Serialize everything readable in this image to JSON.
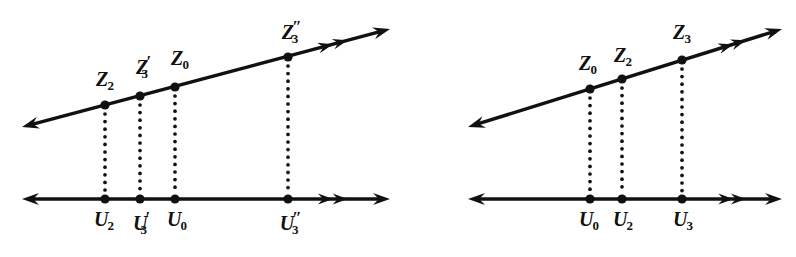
{
  "figure": {
    "background_color": "#ffffff",
    "ink_color": "#111111",
    "panels": [
      {
        "name": "left-panel",
        "slanted_line": {
          "name": "z-axis-line",
          "left_arrowhead": "single",
          "right_arrowhead": "single",
          "mid_chevrons": 2
        },
        "horizontal_line": {
          "name": "u-axis-line",
          "left_arrowhead": "single",
          "right_arrowhead": "single",
          "mid_chevrons": 2
        },
        "points": [
          {
            "z_label": "Z",
            "z_sub": "2",
            "z_prime": "",
            "u_label": "U",
            "u_sub": "2",
            "u_prime": ""
          },
          {
            "z_label": "Z",
            "z_sub": "3",
            "z_prime": "′",
            "u_label": "U",
            "u_sub": "3",
            "u_prime": "′"
          },
          {
            "z_label": "Z",
            "z_sub": "0",
            "z_prime": "",
            "u_label": "U",
            "u_sub": "0",
            "u_prime": ""
          },
          {
            "z_label": "Z",
            "z_sub": "3",
            "z_prime": "″",
            "u_label": "U",
            "u_sub": "3",
            "u_prime": "″"
          }
        ]
      },
      {
        "name": "right-panel",
        "slanted_line": {
          "name": "z-axis-line",
          "left_arrowhead": "single",
          "right_arrowhead": "single",
          "mid_chevrons": 2
        },
        "horizontal_line": {
          "name": "u-axis-line",
          "left_arrowhead": "single",
          "right_arrowhead": "single",
          "mid_chevrons": 2
        },
        "points": [
          {
            "z_label": "Z",
            "z_sub": "0",
            "z_prime": "",
            "u_label": "U",
            "u_sub": "0",
            "u_prime": ""
          },
          {
            "z_label": "Z",
            "z_sub": "2",
            "z_prime": "",
            "u_label": "U",
            "u_sub": "2",
            "u_prime": ""
          },
          {
            "z_label": "Z",
            "z_sub": "3",
            "z_prime": "",
            "u_label": "U",
            "u_sub": "3",
            "u_prime": ""
          }
        ]
      }
    ]
  },
  "chart_data": {
    "type": "scatter",
    "title": "",
    "xlabel": "",
    "ylabel": "",
    "grid": false,
    "legend": null,
    "panels": [
      {
        "id": "left",
        "u_line_y": 199,
        "z_line": {
          "x1": 22,
          "y1": 127,
          "x2": 390,
          "y2": 29
        },
        "u_line": {
          "x1": 22,
          "y1": 199,
          "x2": 390,
          "y2": 199
        },
        "points_x": [
          105,
          140,
          175,
          288
        ],
        "z_points": [
          {
            "label": "Z_2",
            "x": 105,
            "y": 105
          },
          {
            "label": "Z_3prime",
            "x": 140,
            "y": 96
          },
          {
            "label": "Z_0",
            "x": 175,
            "y": 87
          },
          {
            "label": "Z_3dprime",
            "x": 288,
            "y": 57
          }
        ],
        "u_points": [
          {
            "label": "U_2",
            "x": 105,
            "y": 199
          },
          {
            "label": "U_3prime",
            "x": 140,
            "y": 199
          },
          {
            "label": "U_0",
            "x": 175,
            "y": 199
          },
          {
            "label": "U_3dprime",
            "x": 288,
            "y": 199
          }
        ]
      },
      {
        "id": "right",
        "u_line_y": 199,
        "z_line": {
          "x1": 468,
          "y1": 127,
          "x2": 782,
          "y2": 29
        },
        "u_line": {
          "x1": 468,
          "y1": 199,
          "x2": 782,
          "y2": 199
        },
        "points_x": [
          590,
          622,
          682
        ],
        "z_points": [
          {
            "label": "Z_0",
            "x": 590,
            "y": 89
          },
          {
            "label": "Z_2",
            "x": 622,
            "y": 79
          },
          {
            "label": "Z_3",
            "x": 682,
            "y": 60
          }
        ],
        "u_points": [
          {
            "label": "U_0",
            "x": 590,
            "y": 199
          },
          {
            "label": "U_2",
            "x": 622,
            "y": 199
          },
          {
            "label": "U_3",
            "x": 682,
            "y": 199
          }
        ]
      }
    ]
  },
  "labels": {
    "left_z": [
      {
        "name": "label-z2",
        "x": 105,
        "y": 69,
        "base": "Z",
        "prime": "",
        "sub": "2"
      },
      {
        "name": "label-z3-prime",
        "x": 142,
        "y": 53,
        "base": "Z",
        "prime": "′",
        "sub": "3"
      },
      {
        "name": "label-z0",
        "x": 180,
        "y": 48,
        "base": "Z",
        "prime": "",
        "sub": "0"
      },
      {
        "name": "label-z3-dprime",
        "x": 290,
        "y": 18,
        "base": "Z",
        "prime": "″",
        "sub": "3"
      }
    ],
    "left_u": [
      {
        "name": "label-u2",
        "x": 104,
        "y": 209,
        "base": "U",
        "prime": "",
        "sub": "2"
      },
      {
        "name": "label-u3-prime",
        "x": 140,
        "y": 209,
        "base": "U",
        "prime": "′",
        "sub": "3"
      },
      {
        "name": "label-u0",
        "x": 177,
        "y": 209,
        "base": "U",
        "prime": "",
        "sub": "0"
      },
      {
        "name": "label-u3-dprime",
        "x": 289,
        "y": 209,
        "base": "U",
        "prime": "″",
        "sub": "3"
      }
    ],
    "right_z": [
      {
        "name": "label-z0",
        "x": 588,
        "y": 53,
        "base": "Z",
        "prime": "",
        "sub": "0"
      },
      {
        "name": "label-z2",
        "x": 623,
        "y": 45,
        "base": "Z",
        "prime": "",
        "sub": "2"
      },
      {
        "name": "label-z3",
        "x": 682,
        "y": 22,
        "base": "Z",
        "prime": "",
        "sub": "3"
      }
    ],
    "right_u": [
      {
        "name": "label-u0",
        "x": 589,
        "y": 209,
        "base": "U",
        "prime": "",
        "sub": "0"
      },
      {
        "name": "label-u2",
        "x": 623,
        "y": 209,
        "base": "U",
        "prime": "",
        "sub": "2"
      },
      {
        "name": "label-u3",
        "x": 683,
        "y": 209,
        "base": "U",
        "prime": "",
        "sub": "3"
      }
    ]
  }
}
